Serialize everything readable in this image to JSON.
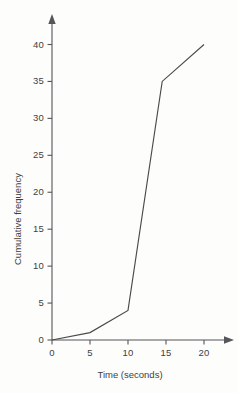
{
  "chart_data": {
    "type": "line",
    "title": "",
    "xlabel": "Time (seconds)",
    "ylabel": "Cumulative frequency",
    "xlim": [
      0,
      20
    ],
    "ylim": [
      0,
      40
    ],
    "grid": false,
    "legend": "none",
    "x_ticks": [
      "0",
      "5",
      "10",
      "15",
      "20"
    ],
    "y_ticks": [
      "0",
      "5",
      "10",
      "15",
      "20",
      "25",
      "30",
      "35",
      "40"
    ],
    "x_tick_values": [
      0,
      5,
      10,
      15,
      20
    ],
    "y_tick_values": [
      0,
      5,
      10,
      15,
      20,
      25,
      30,
      35,
      40
    ],
    "series": [
      {
        "name": "Cumulative frequency",
        "x": [
          0,
          5,
          10,
          14.5,
          20
        ],
        "values": [
          0,
          1,
          4,
          35,
          40
        ]
      }
    ]
  },
  "style": {
    "line_color": "#4a4a4a",
    "axis_color": "#55555a",
    "text_color": "#3f3f3f",
    "background": "#fdfdfc"
  },
  "axis_ticks_x": [
    {
      "label": "0"
    },
    {
      "label": "5"
    },
    {
      "label": "10"
    },
    {
      "label": "15"
    },
    {
      "label": "20"
    }
  ],
  "axis_ticks_y": [
    {
      "label": "0"
    },
    {
      "label": "5"
    },
    {
      "label": "10"
    },
    {
      "label": "15"
    },
    {
      "label": "20"
    },
    {
      "label": "25"
    },
    {
      "label": "30"
    },
    {
      "label": "35"
    },
    {
      "label": "40"
    }
  ]
}
